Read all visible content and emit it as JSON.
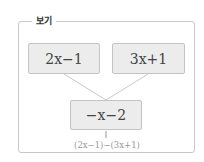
{
  "panel": {
    "title": "보기"
  },
  "boxes": {
    "top_left": "2x−1",
    "top_right": "3x+1",
    "bottom": "−x−2"
  },
  "annotation": {
    "formula": "(2x−1)−(3x+1)"
  },
  "colors": {
    "box_fill": "#ececec",
    "box_border": "#c4c4c4",
    "text": "#444444",
    "annotation_text": "#999999"
  }
}
